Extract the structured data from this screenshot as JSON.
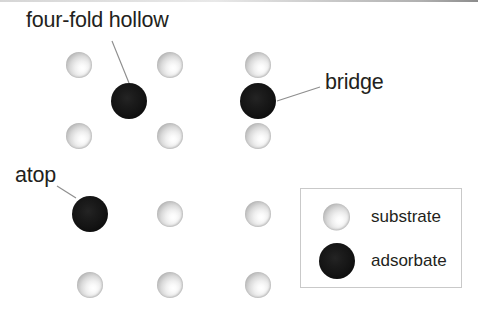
{
  "figure": {
    "background_color": "#ffffff",
    "text_color": "#231f20",
    "leader_line_color": "#8e8e8e"
  },
  "annotations": [
    {
      "id": "four-fold-hollow",
      "label": "four-fold hollow",
      "text_x": 26,
      "text_y": 10,
      "leader": {
        "x1": 112,
        "y1": 41,
        "x2": 129,
        "y2": 83
      }
    },
    {
      "id": "bridge",
      "label": "bridge",
      "text_x": 325,
      "text_y": 72,
      "leader": {
        "x1": 320,
        "y1": 87,
        "x2": 277,
        "y2": 101
      }
    },
    {
      "id": "atop",
      "label": "atop",
      "text_x": 15,
      "text_y": 165,
      "leader": {
        "x1": 57,
        "y1": 186,
        "x2": 76,
        "y2": 198
      }
    }
  ],
  "atoms": [
    {
      "kind": "substrate",
      "cx": 79,
      "cy": 65,
      "r": 13
    },
    {
      "kind": "substrate",
      "cx": 170,
      "cy": 65,
      "r": 13
    },
    {
      "kind": "substrate",
      "cx": 258,
      "cy": 65,
      "r": 13
    },
    {
      "kind": "adsorbate",
      "cx": 129,
      "cy": 101,
      "r": 18,
      "site": "four-fold hollow"
    },
    {
      "kind": "adsorbate",
      "cx": 258,
      "cy": 101,
      "r": 18,
      "site": "bridge"
    },
    {
      "kind": "substrate",
      "cx": 79,
      "cy": 136,
      "r": 13
    },
    {
      "kind": "substrate",
      "cx": 170,
      "cy": 136,
      "r": 13
    },
    {
      "kind": "substrate",
      "cx": 258,
      "cy": 136,
      "r": 13
    },
    {
      "kind": "adsorbate",
      "cx": 90,
      "cy": 214,
      "r": 18,
      "site": "atop"
    },
    {
      "kind": "substrate",
      "cx": 170,
      "cy": 214,
      "r": 13
    },
    {
      "kind": "substrate",
      "cx": 258,
      "cy": 214,
      "r": 13
    },
    {
      "kind": "substrate",
      "cx": 90,
      "cy": 285,
      "r": 13
    },
    {
      "kind": "substrate",
      "cx": 170,
      "cy": 285,
      "r": 13
    },
    {
      "kind": "substrate",
      "cx": 258,
      "cy": 285,
      "r": 13
    }
  ],
  "legend": {
    "box": {
      "x": 300,
      "y": 188,
      "width": 162,
      "height": 100
    },
    "border_color": "#c9c9c9",
    "items": [
      {
        "id": "substrate",
        "label": "substrate",
        "swatch": "substrate-sphere"
      },
      {
        "id": "adsorbate",
        "label": "adsorbate",
        "swatch": "adsorbate-sphere"
      }
    ]
  }
}
